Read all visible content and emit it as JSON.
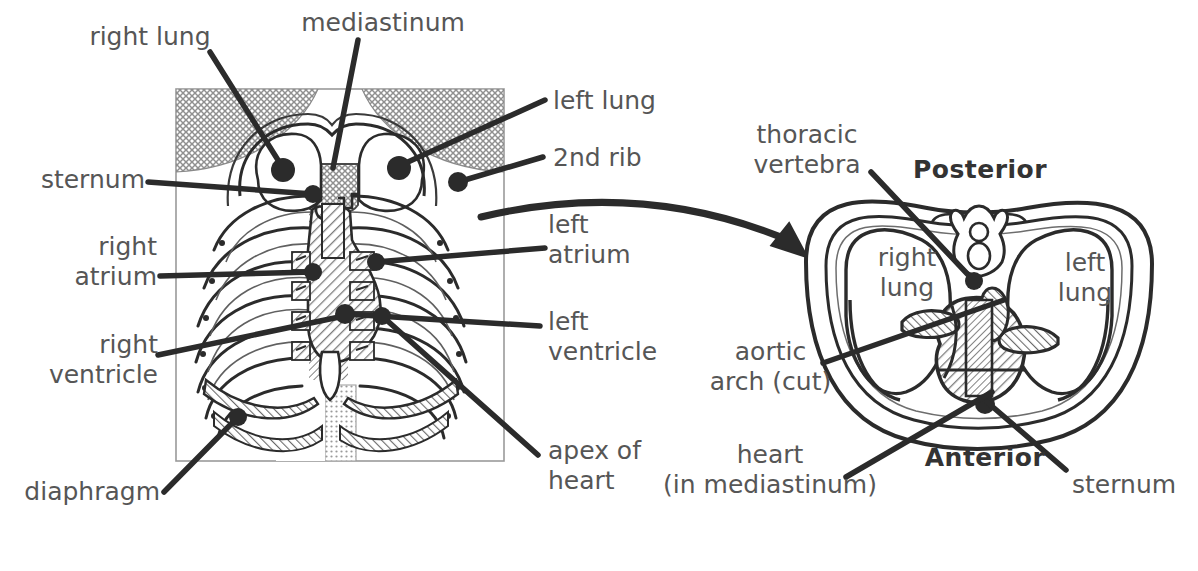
{
  "figure": {
    "background_color": "#ffffff",
    "ink_color": "#2b2b2b",
    "label_color": "#565656",
    "hatch_color": "#8a8a8a"
  },
  "left_panel": {
    "name": "anterior-thoracic-view",
    "frame": {
      "x": 175,
      "y": 88,
      "width": 330,
      "height": 374
    },
    "labels": [
      {
        "id": "right-lung",
        "text": "right lung",
        "x": 80,
        "y": 22,
        "width": 140,
        "align": "center",
        "leader": [
          [
            210,
            52
          ],
          [
            282,
            168
          ]
        ],
        "dot": [
          282,
          168
        ]
      },
      {
        "id": "mediastinum",
        "text": "mediastinum",
        "x": 283,
        "y": 8,
        "width": 200,
        "align": "center",
        "leader": [
          [
            357,
            40
          ],
          [
            333,
            165
          ]
        ],
        "dot": null
      },
      {
        "id": "left-lung",
        "text": "left lung",
        "x": 553,
        "y": 86,
        "width": 130,
        "align": "left",
        "leader": [
          [
            543,
            102
          ],
          [
            399,
            166
          ]
        ],
        "dot": [
          399,
          166
        ]
      },
      {
        "id": "2nd-rib",
        "text": "2nd rib",
        "x": 553,
        "y": 143,
        "width": 120,
        "align": "left",
        "leader": [
          [
            541,
            158
          ],
          [
            456,
            182
          ]
        ],
        "dot": [
          456,
          182
        ]
      },
      {
        "id": "sternum-left",
        "text": "sternum",
        "x": 20,
        "y": 165,
        "width": 125,
        "align": "right",
        "leader": [
          [
            150,
            183
          ],
          [
            313,
            194
          ]
        ],
        "dot": [
          313,
          194
        ]
      },
      {
        "id": "left-atrium",
        "text": "left\natrium",
        "x": 548,
        "y": 210,
        "width": 110,
        "align": "left",
        "leader": [
          [
            545,
            248
          ],
          [
            375,
            262
          ]
        ],
        "dot": [
          375,
          262
        ]
      },
      {
        "id": "right-atrium",
        "text": "right\natrium",
        "x": 22,
        "y": 232,
        "width": 135,
        "align": "right",
        "leader": [
          [
            163,
            276
          ],
          [
            312,
            272
          ]
        ],
        "dot": [
          312,
          272
        ]
      },
      {
        "id": "left-ventricle",
        "text": "left\nventricle",
        "x": 548,
        "y": 307,
        "width": 130,
        "align": "left",
        "leader": [
          [
            540,
            327
          ],
          [
            343,
            315
          ]
        ],
        "dot": [
          343,
          315
        ]
      },
      {
        "id": "right-ventricle",
        "text": "right\nventricle",
        "x": 18,
        "y": 330,
        "width": 140,
        "align": "right",
        "leader": [
          [
            160,
            355
          ],
          [
            343,
            315
          ]
        ],
        "dot": [
          343,
          315
        ]
      },
      {
        "id": "apex-of-heart",
        "text": "apex of\nheart",
        "x": 548,
        "y": 436,
        "width": 130,
        "align": "left",
        "leader": [
          [
            538,
            456
          ],
          [
            381,
            316
          ]
        ],
        "dot": [
          381,
          316
        ]
      },
      {
        "id": "diaphragm",
        "text": "diaphragm",
        "x": 10,
        "y": 477,
        "width": 150,
        "align": "right",
        "leader": [
          [
            166,
            493
          ],
          [
            237,
            417
          ]
        ],
        "dot": [
          237,
          417
        ]
      }
    ]
  },
  "right_panel": {
    "name": "transverse-section-view",
    "orientation": {
      "top": "Posterior",
      "bottom": "Anterior"
    },
    "inner_labels": [
      {
        "id": "right-lung-inner",
        "text": "right\nlung",
        "x": 862,
        "y": 243,
        "width": 90,
        "align": "center"
      },
      {
        "id": "left-lung-inner",
        "text": "left\nlung",
        "x": 1040,
        "y": 248,
        "width": 90,
        "align": "center"
      }
    ],
    "labels": [
      {
        "id": "thoracic-vertebra",
        "text": "thoracic\nvertebra",
        "x": 737,
        "y": 120,
        "width": 140,
        "align": "center",
        "leader": [
          [
            870,
            172
          ],
          [
            973,
            280
          ]
        ],
        "dot": [
          973,
          280
        ]
      },
      {
        "id": "posterior",
        "text": "Posterior",
        "x": 900,
        "y": 155,
        "width": 160,
        "align": "center",
        "bold": true
      },
      {
        "id": "aortic-arch-cut",
        "text": "aortic\narch (cut)",
        "x": 688,
        "y": 337,
        "width": 165,
        "align": "center",
        "leader": [
          [
            822,
            363
          ],
          [
            1000,
            300
          ]
        ],
        "dot": null
      },
      {
        "id": "heart-in-mediastinum",
        "text": "heart\n(in mediastinum)",
        "x": 640,
        "y": 440,
        "width": 260,
        "align": "center",
        "leader": [
          [
            845,
            477
          ],
          [
            990,
            390
          ]
        ],
        "dot": null
      },
      {
        "id": "anterior",
        "text": "Anterior",
        "x": 910,
        "y": 443,
        "width": 150,
        "align": "center",
        "bold": true
      },
      {
        "id": "sternum-right",
        "text": "sternum",
        "x": 1072,
        "y": 470,
        "width": 125,
        "align": "left",
        "leader": [
          [
            1068,
            472
          ],
          [
            988,
            400
          ]
        ],
        "dot": [
          988,
          400
        ]
      }
    ]
  },
  "connector_arrow": {
    "name": "section-level-arrow",
    "from": [
      481,
      217
    ],
    "control": [
      645,
      178
    ],
    "to": [
      808,
      248
    ]
  }
}
